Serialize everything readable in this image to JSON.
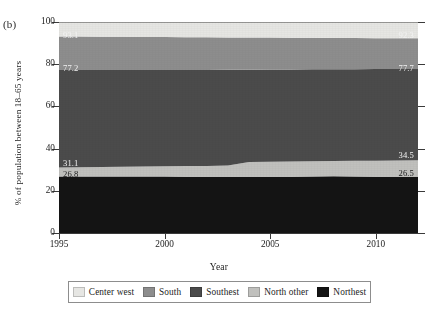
{
  "panel": {
    "label": "(b)"
  },
  "axes": {
    "y_title": "% of population between 18–65 years",
    "x_title": "Year",
    "y_ticks": [
      "0",
      "20",
      "40",
      "60",
      "80",
      "100"
    ],
    "x_ticks": [
      "1995",
      "2000",
      "2005",
      "2010"
    ]
  },
  "value_labels": {
    "left": {
      "center_west_bottom": "93.1",
      "south_bottom": "77.2",
      "north_other_top": "31.1",
      "northest_top": "26.8"
    },
    "right": {
      "center_west_bottom": "92.3",
      "south_bottom": "77.7",
      "north_other_top": "34.5",
      "northest_top": "26.5"
    }
  },
  "legend": {
    "items": [
      {
        "label": "Center west",
        "color": "#e6e6e3"
      },
      {
        "label": "South",
        "color": "#8d8d8d"
      },
      {
        "label": "Southest",
        "color": "#4b4b4b"
      },
      {
        "label": "North other",
        "color": "#c0c0bd"
      },
      {
        "label": "Northest",
        "color": "#141414"
      }
    ]
  },
  "chart_data": {
    "type": "area",
    "stacked": true,
    "title": "",
    "subtitle": "",
    "xlabel": "Year",
    "ylabel": "% of population between 18–65 years",
    "xlim": [
      1995,
      2012
    ],
    "ylim": [
      0,
      100
    ],
    "grid": false,
    "legend_position": "bottom",
    "panel_label": "(b)",
    "x": [
      1995,
      1996,
      1997,
      1998,
      1999,
      2000,
      2001,
      2002,
      2003,
      2004,
      2005,
      2006,
      2007,
      2008,
      2009,
      2010,
      2011,
      2012
    ],
    "series": [
      {
        "name": "Northest",
        "color": "#141414",
        "order": 1,
        "cumulative_top": [
          26.8,
          26.8,
          26.8,
          26.8,
          26.8,
          26.8,
          26.7,
          26.7,
          26.6,
          26.6,
          26.6,
          26.7,
          26.8,
          26.9,
          26.8,
          26.7,
          26.6,
          26.5
        ],
        "values": [
          26.8,
          26.8,
          26.8,
          26.8,
          26.8,
          26.8,
          26.7,
          26.7,
          26.6,
          26.6,
          26.6,
          26.7,
          26.8,
          26.9,
          26.8,
          26.7,
          26.6,
          26.5
        ]
      },
      {
        "name": "North other",
        "color": "#c0c0bd",
        "order": 2,
        "cumulative_top": [
          31.1,
          31.2,
          31.3,
          31.4,
          31.5,
          31.6,
          31.7,
          31.8,
          32.0,
          33.6,
          33.8,
          33.9,
          34.0,
          34.1,
          34.2,
          34.3,
          34.4,
          34.5
        ],
        "values": [
          4.3,
          4.4,
          4.5,
          4.6,
          4.7,
          4.8,
          5.0,
          5.1,
          5.4,
          7.0,
          7.2,
          7.2,
          7.2,
          7.2,
          7.4,
          7.6,
          7.8,
          8.0
        ]
      },
      {
        "name": "Southest",
        "color": "#4b4b4b",
        "order": 3,
        "cumulative_top": [
          77.2,
          77.2,
          77.2,
          77.2,
          77.2,
          77.3,
          77.3,
          77.3,
          77.4,
          77.4,
          77.5,
          77.5,
          77.6,
          77.6,
          77.6,
          77.7,
          77.7,
          77.7
        ],
        "values": [
          46.1,
          46.0,
          45.9,
          45.8,
          45.7,
          45.7,
          45.6,
          45.5,
          45.4,
          43.8,
          43.7,
          43.6,
          43.6,
          43.5,
          43.4,
          43.4,
          43.3,
          43.2
        ]
      },
      {
        "name": "South",
        "color": "#8d8d8d",
        "order": 4,
        "cumulative_top": [
          93.1,
          93.1,
          93.0,
          93.0,
          92.9,
          92.9,
          92.8,
          92.8,
          92.7,
          92.6,
          92.6,
          92.5,
          92.5,
          92.4,
          92.4,
          92.3,
          92.3,
          92.3
        ],
        "values": [
          15.9,
          15.9,
          15.8,
          15.8,
          15.7,
          15.6,
          15.5,
          15.5,
          15.3,
          15.2,
          15.1,
          15.0,
          14.9,
          14.8,
          14.8,
          14.6,
          14.6,
          14.6
        ]
      },
      {
        "name": "Center west",
        "color": "#e6e6e3",
        "order": 5,
        "cumulative_top": [
          100,
          100,
          100,
          100,
          100,
          100,
          100,
          100,
          100,
          100,
          100,
          100,
          100,
          100,
          100,
          100,
          100,
          100
        ],
        "values": [
          6.9,
          6.9,
          7.0,
          7.0,
          7.1,
          7.1,
          7.2,
          7.2,
          7.3,
          7.4,
          7.4,
          7.5,
          7.5,
          7.6,
          7.6,
          7.7,
          7.7,
          7.7
        ]
      }
    ],
    "endpoint_annotations": {
      "left_x": 1995,
      "right_x": 2012,
      "left": [
        {
          "value": "93.1",
          "boundary": "South / Center west"
        },
        {
          "value": "77.2",
          "boundary": "Southest / South"
        },
        {
          "value": "31.1",
          "boundary": "North other / Southest"
        },
        {
          "value": "26.8",
          "boundary": "Northest / North other"
        }
      ],
      "right": [
        {
          "value": "92.3",
          "boundary": "South / Center west"
        },
        {
          "value": "77.7",
          "boundary": "Southest / South"
        },
        {
          "value": "34.5",
          "boundary": "North other / Southest"
        },
        {
          "value": "26.5",
          "boundary": "Northest / North other"
        }
      ]
    }
  }
}
